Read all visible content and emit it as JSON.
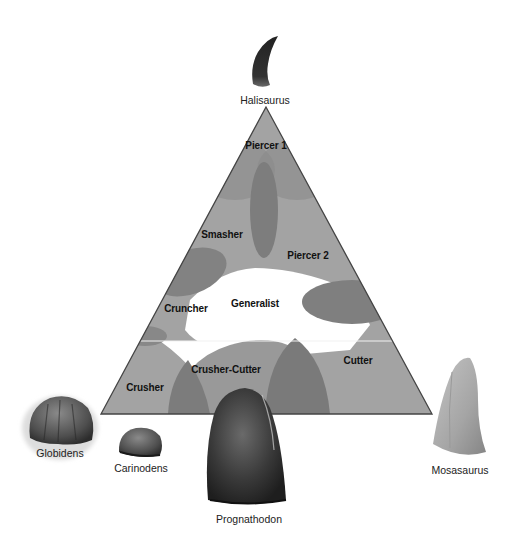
{
  "diagram": {
    "type": "ternary-ecomorphospace",
    "colors": {
      "triangle_fill": "#9c9c9c",
      "overlap_fill": "#7a7a7a",
      "generalist_fill": "#ffffff",
      "edge": "#444444"
    },
    "zones": [
      {
        "id": "piercer-1",
        "label": "Piercer 1"
      },
      {
        "id": "smasher",
        "label": "Smasher"
      },
      {
        "id": "piercer-2",
        "label": "Piercer 2"
      },
      {
        "id": "cruncher",
        "label": "Cruncher"
      },
      {
        "id": "generalist",
        "label": "Generalist"
      },
      {
        "id": "cutter",
        "label": "Cutter"
      },
      {
        "id": "crusher-cutter",
        "label": "Crusher-Cutter"
      },
      {
        "id": "crusher",
        "label": "Crusher"
      }
    ],
    "taxa": [
      {
        "id": "halisaurus",
        "label": "Halisaurus"
      },
      {
        "id": "globidens",
        "label": "Globidens"
      },
      {
        "id": "carinodens",
        "label": "Carinodens"
      },
      {
        "id": "prognathodon",
        "label": "Prognathodon"
      },
      {
        "id": "mosasaurus",
        "label": "Mosasaurus"
      }
    ]
  }
}
